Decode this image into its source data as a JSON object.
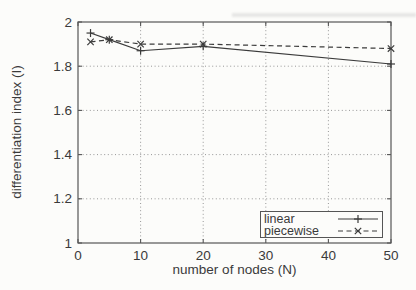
{
  "chart_data": {
    "type": "line",
    "title": "",
    "xlabel": "number of nodes (N)",
    "ylabel": "differentiation index (I)",
    "xlim": [
      0,
      50
    ],
    "ylim": [
      1,
      2
    ],
    "xticks": [
      0,
      10,
      20,
      30,
      40,
      50
    ],
    "xtick_labels": [
      "0",
      "10",
      "20",
      "30",
      "40",
      "50"
    ],
    "yticks": [
      1,
      1.2,
      1.4,
      1.6,
      1.8,
      2
    ],
    "ytick_labels": [
      "1",
      "1.2",
      "1.4",
      "1.6",
      "1.8",
      "2"
    ],
    "grid": true,
    "legend_position": "bottom-right",
    "series": [
      {
        "name": "linear",
        "line_style": "solid",
        "marker": "plus",
        "x": [
          2,
          5,
          10,
          20,
          50
        ],
        "y": [
          1.95,
          1.92,
          1.87,
          1.89,
          1.81
        ]
      },
      {
        "name": "piecewise",
        "line_style": "dashed",
        "marker": "cross",
        "x": [
          2,
          5,
          10,
          20,
          50
        ],
        "y": [
          1.91,
          1.92,
          1.9,
          1.9,
          1.88
        ]
      }
    ],
    "colors": {
      "line": "#3b3b3b",
      "grid": "#979797",
      "frame": "#565656",
      "text": "#3a3a3a",
      "background": "#fcfcfa"
    }
  },
  "legend": {
    "items": [
      {
        "label": "linear"
      },
      {
        "label": "piecewise"
      }
    ]
  }
}
